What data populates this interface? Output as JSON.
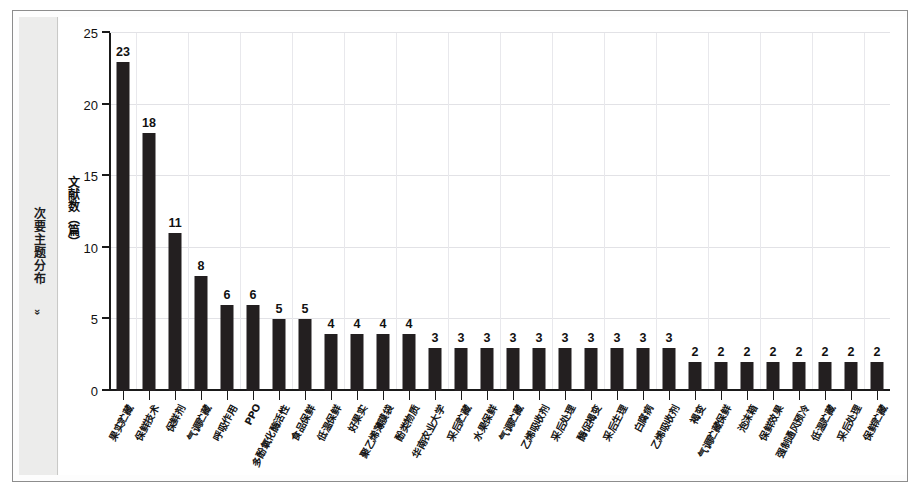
{
  "sidebar": {
    "label": "次要主题分布",
    "chevron": "»"
  },
  "chart_data": {
    "type": "bar",
    "title": "",
    "subtitle": "",
    "xlabel": "",
    "ylabel": "文献数（篇）",
    "ylim": [
      0,
      25
    ],
    "yticks": [
      0,
      5,
      10,
      15,
      20,
      25
    ],
    "ytick_labels": [
      "0",
      "5",
      "10",
      "15",
      "20",
      "25"
    ],
    "grid": true,
    "legend": "none",
    "bar_color": "#231f20",
    "show_value_labels": true,
    "categories": [
      "果实贮藏",
      "保鲜技术",
      "保鲜剂",
      "气调贮藏",
      "呼吸作用",
      "PPO",
      "多酚氧化酶活性",
      "食品保鲜",
      "低温保鲜",
      "好果实",
      "聚乙烯薄膜袋",
      "酚类物质",
      "华南农业大学",
      "采后贮藏",
      "水果保鲜",
      "气调贮藏",
      "乙烯吸收剂",
      "采后处理",
      "酶促褐变",
      "采后生理",
      "白腐病",
      "乙烯吸收剂",
      "褐变",
      "气调贮藏保鲜",
      "泡沫箱",
      "保鲜效果",
      "强制通风预冷",
      "低温贮藏",
      "采后处理",
      "保鲜贮藏"
    ],
    "values": [
      23,
      18,
      11,
      8,
      6,
      6,
      5,
      5,
      4,
      4,
      4,
      4,
      3,
      3,
      3,
      3,
      3,
      3,
      3,
      3,
      3,
      3,
      2,
      2,
      2,
      2,
      2,
      2,
      2,
      2
    ]
  }
}
